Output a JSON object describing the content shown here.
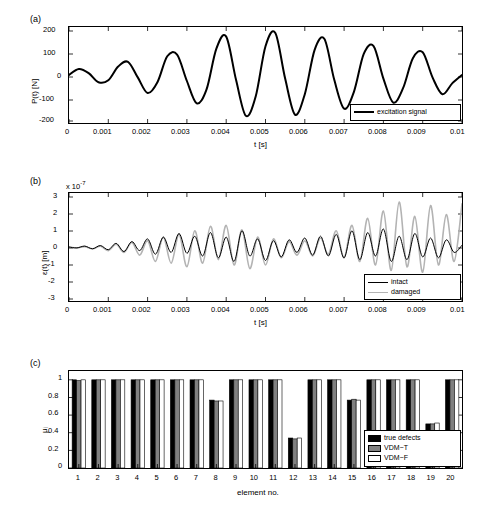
{
  "figure": {
    "panels": [
      {
        "tag": "(a)"
      },
      {
        "tag": "(b)"
      },
      {
        "tag": "(c)"
      }
    ]
  },
  "chart_data": [
    {
      "type": "line",
      "panel": "(a)",
      "title": "",
      "xlabel": "t [s]",
      "ylabel": "P(t) [N]",
      "xlim": [
        0,
        0.01
      ],
      "ylim": [
        -200,
        200
      ],
      "xticks": [
        "0",
        "0.001",
        "0.002",
        "0.003",
        "0.004",
        "0.005",
        "0.006",
        "0.007",
        "0.008",
        "0.009",
        "0.01"
      ],
      "yticks": [
        "-200",
        "-100",
        "0",
        "100",
        "200"
      ],
      "grid": false,
      "legend": {
        "position": "bottom-right",
        "entries": [
          {
            "name": "excitation signal",
            "color": "#000000",
            "width": 2
          }
        ]
      },
      "series": [
        {
          "name": "excitation signal",
          "color": "#000000",
          "x": [
            0,
            0.00025,
            0.0005,
            0.00075,
            0.001,
            0.00125,
            0.0015,
            0.00175,
            0.002,
            0.00225,
            0.0025,
            0.00275,
            0.003,
            0.00325,
            0.0035,
            0.00375,
            0.004,
            0.00425,
            0.0045,
            0.00475,
            0.005,
            0.00525,
            0.0055,
            0.00575,
            0.006,
            0.00625,
            0.0065,
            0.00675,
            0.007,
            0.00725,
            0.0075,
            0.00775,
            0.008,
            0.00825,
            0.0085,
            0.00875,
            0.009,
            0.00925,
            0.0095,
            0.00975,
            0.01
          ],
          "y": [
            0,
            25,
            8,
            -30,
            -22,
            35,
            55,
            -10,
            -75,
            -30,
            78,
            85,
            -25,
            -118,
            -60,
            110,
            160,
            -20,
            -170,
            -90,
            120,
            175,
            -15,
            -165,
            -80,
            105,
            150,
            -20,
            -140,
            -70,
            88,
            120,
            -15,
            -115,
            -55,
            70,
            95,
            -10,
            -80,
            -35,
            0
          ]
        }
      ]
    },
    {
      "type": "line",
      "panel": "(b)",
      "title": "",
      "xlabel": "t [s]",
      "ylabel": "ε(t) [m]",
      "y_exponent": "x 10",
      "y_exponent_power": "-7",
      "xlim": [
        0,
        0.01
      ],
      "ylim": [
        -3,
        3
      ],
      "xticks": [
        "0",
        "0.001",
        "0.002",
        "0.003",
        "0.004",
        "0.005",
        "0.006",
        "0.007",
        "0.008",
        "0.009",
        "0.01"
      ],
      "yticks": [
        "-3",
        "-2",
        "-1",
        "0",
        "1",
        "2",
        "3"
      ],
      "grid": false,
      "legend": {
        "position": "bottom-right",
        "entries": [
          {
            "name": "intact",
            "color": "#000000",
            "width": 1
          },
          {
            "name": "damaged",
            "color": "#b3b3b3",
            "width": 1.6
          }
        ]
      },
      "series": [
        {
          "name": "intact",
          "color": "#000000",
          "x": [
            0,
            0.0002,
            0.0004,
            0.0006,
            0.0008,
            0.001,
            0.0012,
            0.0014,
            0.0016,
            0.0018,
            0.002,
            0.0022,
            0.0024,
            0.0026,
            0.0028,
            0.003,
            0.0032,
            0.0034,
            0.0036,
            0.0038,
            0.004,
            0.0042,
            0.0044,
            0.0046,
            0.0048,
            0.005,
            0.0052,
            0.0054,
            0.0056,
            0.0058,
            0.006,
            0.0062,
            0.0064,
            0.0066,
            0.0068,
            0.007,
            0.0072,
            0.0074,
            0.0076,
            0.0078,
            0.008,
            0.0082,
            0.0084,
            0.0086,
            0.0088,
            0.009,
            0.0092,
            0.0094,
            0.0096,
            0.0098,
            0.01
          ],
          "y": [
            0,
            -0.05,
            0.05,
            -0.1,
            0.08,
            -0.15,
            0.2,
            -0.25,
            0.3,
            -0.2,
            0.45,
            -0.4,
            0.55,
            -0.3,
            0.75,
            -0.35,
            0.6,
            -0.5,
            0.8,
            -0.6,
            0.55,
            -0.8,
            0.9,
            -0.5,
            0.45,
            -0.75,
            0.35,
            -0.55,
            0.4,
            -0.3,
            0.5,
            -0.45,
            0.6,
            -0.5,
            0.7,
            -0.6,
            0.9,
            -0.7,
            0.8,
            -0.5,
            1.0,
            -0.8,
            0.6,
            -0.7,
            0.75,
            -0.55,
            0.5,
            -0.6,
            0.4,
            -0.3,
            0.1
          ]
        },
        {
          "name": "damaged",
          "color": "#b3b3b3",
          "x": [
            0,
            0.0002,
            0.0004,
            0.0006,
            0.0008,
            0.001,
            0.0012,
            0.0014,
            0.0016,
            0.0018,
            0.002,
            0.0022,
            0.0024,
            0.0026,
            0.0028,
            0.003,
            0.0032,
            0.0034,
            0.0036,
            0.0038,
            0.004,
            0.0042,
            0.0044,
            0.0046,
            0.0048,
            0.005,
            0.0052,
            0.0054,
            0.0056,
            0.0058,
            0.006,
            0.0062,
            0.0064,
            0.0066,
            0.0068,
            0.007,
            0.0072,
            0.0074,
            0.0076,
            0.0078,
            0.008,
            0.0082,
            0.0084,
            0.0086,
            0.0088,
            0.009,
            0.0092,
            0.0094,
            0.0096,
            0.0098,
            0.01
          ],
          "y": [
            0,
            -0.05,
            0.02,
            -0.1,
            0.05,
            -0.2,
            0.15,
            -0.3,
            0.25,
            -0.45,
            0.35,
            -0.8,
            0.55,
            -0.9,
            0.7,
            -1.1,
            0.9,
            -0.9,
            1.15,
            -0.7,
            1.2,
            -1.0,
            0.95,
            -1.2,
            0.55,
            -1.0,
            0.45,
            -0.6,
            0.3,
            -0.45,
            0.35,
            -0.5,
            0.5,
            -0.4,
            0.9,
            -0.6,
            1.2,
            -0.8,
            1.6,
            -1.0,
            2.0,
            -1.3,
            2.5,
            -1.1,
            1.7,
            -1.4,
            2.3,
            -1.0,
            1.8,
            -0.8,
            2.4
          ]
        }
      ]
    },
    {
      "type": "bar",
      "panel": "(c)",
      "title": "",
      "xlabel": "element no.",
      "ylabel": "μᵢ",
      "ylim": [
        0,
        1.1
      ],
      "yticks": [
        "0",
        "0.2",
        "0.4",
        "0.6",
        "0.8",
        "1"
      ],
      "categories": [
        "1",
        "2",
        "3",
        "4",
        "5",
        "6",
        "7",
        "8",
        "9",
        "10",
        "11",
        "12",
        "13",
        "14",
        "15",
        "16",
        "17",
        "18",
        "19",
        "20"
      ],
      "grid": false,
      "legend": {
        "position": "bottom-right",
        "entries": [
          {
            "name": "true defects",
            "color": "#000000"
          },
          {
            "name": "VDM−T",
            "color": "#808080"
          },
          {
            "name": "VDM−F",
            "color": "#ffffff"
          }
        ]
      },
      "series": [
        {
          "name": "true defects",
          "color": "#000000",
          "values": [
            1,
            1,
            1,
            1,
            1,
            1,
            1,
            0.77,
            1,
            1,
            1,
            0.34,
            1,
            1,
            0.77,
            1,
            1,
            1,
            0.5,
            1
          ]
        },
        {
          "name": "VDM−T",
          "color": "#808080",
          "values": [
            0.99,
            1,
            1,
            1,
            1,
            1,
            1,
            0.76,
            1,
            1,
            1,
            0.33,
            1,
            1,
            0.78,
            1,
            1,
            1,
            0.5,
            1
          ]
        },
        {
          "name": "VDM−F",
          "color": "#ffffff",
          "values": [
            1,
            1,
            1,
            1,
            1,
            1,
            1,
            0.76,
            1,
            1,
            1,
            0.34,
            1,
            1,
            0.77,
            1,
            1,
            1,
            0.51,
            1
          ]
        }
      ]
    }
  ]
}
